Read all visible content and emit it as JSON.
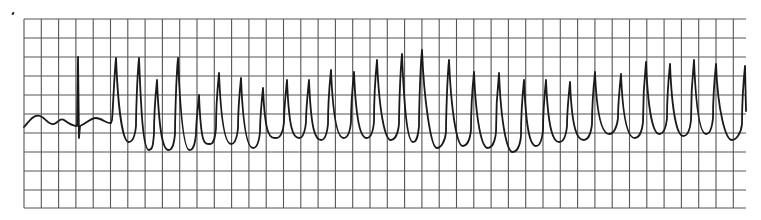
{
  "figure": {
    "type": "ecg-rhythm-strip",
    "colors": {
      "grid": "#555555",
      "trace": "#1a1a1a",
      "background": "#ffffff"
    }
  },
  "grid": {
    "left": 24,
    "right": 746,
    "top": 19,
    "bottom": 208,
    "vertical_spacing": 17.3,
    "horizontal_lines": [
      19,
      38,
      57,
      76,
      95,
      114,
      133,
      152,
      171,
      190,
      208
    ]
  },
  "trace": {
    "baseline_y": 122,
    "initial_segment": {
      "start_x": 24,
      "end_x": 112,
      "narrow_complex_x": 78,
      "narrow_complex_peak_y": 57,
      "narrow_complex_trough_y": 138
    },
    "peaks": [
      {
        "x": 116,
        "y": 58
      },
      {
        "x": 139,
        "y": 58
      },
      {
        "x": 157,
        "y": 80
      },
      {
        "x": 178,
        "y": 58
      },
      {
        "x": 199,
        "y": 95
      },
      {
        "x": 219,
        "y": 73
      },
      {
        "x": 241,
        "y": 78
      },
      {
        "x": 263,
        "y": 88
      },
      {
        "x": 287,
        "y": 80
      },
      {
        "x": 309,
        "y": 80
      },
      {
        "x": 331,
        "y": 70
      },
      {
        "x": 354,
        "y": 72
      },
      {
        "x": 377,
        "y": 60
      },
      {
        "x": 402,
        "y": 54
      },
      {
        "x": 422,
        "y": 50
      },
      {
        "x": 449,
        "y": 60
      },
      {
        "x": 474,
        "y": 72
      },
      {
        "x": 499,
        "y": 73
      },
      {
        "x": 524,
        "y": 80
      },
      {
        "x": 546,
        "y": 80
      },
      {
        "x": 570,
        "y": 82
      },
      {
        "x": 595,
        "y": 72
      },
      {
        "x": 621,
        "y": 74
      },
      {
        "x": 646,
        "y": 62
      },
      {
        "x": 670,
        "y": 64
      },
      {
        "x": 694,
        "y": 60
      },
      {
        "x": 716,
        "y": 64
      },
      {
        "x": 745,
        "y": 66
      }
    ],
    "troughs_y": [
      142,
      150,
      150,
      150,
      144,
      144,
      148,
      138,
      138,
      140,
      138,
      138,
      140,
      142,
      148,
      146,
      148,
      152,
      146,
      142,
      140,
      134,
      138,
      134,
      136,
      134,
      140
    ]
  }
}
